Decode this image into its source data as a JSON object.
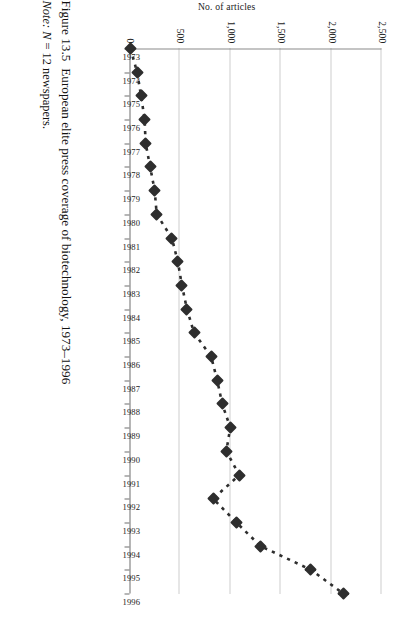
{
  "figure": {
    "caption_number": "Figure 13.5",
    "caption_text": "European elite press coverage of biotechnology, 1973–1996",
    "note_label": "Note:",
    "note_n": "N",
    "note_text": "= 12 newspapers."
  },
  "axes": {
    "value_axis_title": "No. of articles",
    "value_ticks": [
      "2,500",
      "2,000",
      "1,500",
      "1,000",
      "500",
      "0"
    ],
    "value_tick_values": [
      2500,
      2000,
      1500,
      1000,
      500,
      0
    ],
    "value_min": 0,
    "value_max": 2500,
    "category_title": "",
    "category_labels": [
      "1973",
      "1974",
      "1975",
      "1976",
      "1977",
      "1978",
      "1979",
      "1980",
      "1981",
      "1982",
      "1983",
      "1984",
      "1985",
      "1986",
      "1987",
      "1988",
      "1989",
      "1990",
      "1991",
      "1992",
      "1993",
      "1994",
      "1995",
      "1996"
    ]
  },
  "style": {
    "marker_color": "#2e2e2e",
    "line_color": "#2e2e2e",
    "grid_color": "#9a9a9a",
    "axis_color": "#6f6f6f",
    "background": "#ffffff"
  },
  "chart_data": {
    "type": "line",
    "title": "European elite press coverage of biotechnology, 1973–1996",
    "xlabel": "",
    "ylabel": "No. of articles",
    "ylim": [
      0,
      2500
    ],
    "grid": true,
    "legend": "none",
    "marker": "diamond",
    "linestyle": "dotted",
    "categories": [
      "1973",
      "1974",
      "1975",
      "1976",
      "1977",
      "1978",
      "1979",
      "1980",
      "1981",
      "1982",
      "1983",
      "1984",
      "1985",
      "1986",
      "1987",
      "1988",
      "1989",
      "1990",
      "1991",
      "1992",
      "1993",
      "1994",
      "1995",
      "1996"
    ],
    "values": [
      10,
      75,
      115,
      150,
      160,
      205,
      250,
      270,
      420,
      480,
      520,
      570,
      640,
      810,
      870,
      920,
      1000,
      960,
      1090,
      830,
      1060,
      1300,
      1800,
      2120
    ],
    "series": [
      {
        "name": "No. of articles",
        "values": [
          10,
          75,
          115,
          150,
          160,
          205,
          250,
          270,
          420,
          480,
          520,
          570,
          640,
          810,
          870,
          920,
          1000,
          960,
          1090,
          830,
          1060,
          1300,
          1800,
          2120
        ]
      }
    ]
  }
}
